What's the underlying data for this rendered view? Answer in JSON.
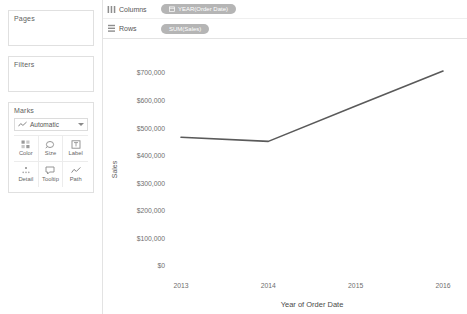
{
  "sidebar": {
    "pages": {
      "title": "Pages"
    },
    "filters": {
      "title": "Filters"
    },
    "marks": {
      "title": "Marks",
      "mark_type": "Automatic",
      "mark_type_icon": "line-mark-icon",
      "buttons": [
        {
          "label": "Color",
          "icon": "color-palette-icon"
        },
        {
          "label": "Size",
          "icon": "size-icon"
        },
        {
          "label": "Label",
          "icon": "label-icon"
        },
        {
          "label": "Detail",
          "icon": "detail-icon"
        },
        {
          "label": "Tooltip",
          "icon": "tooltip-icon"
        },
        {
          "label": "Path",
          "icon": "path-icon"
        }
      ]
    }
  },
  "shelves": [
    {
      "name": "Columns",
      "icon": "columns-icon",
      "pill": {
        "label": "YEAR(Order Date)",
        "icon": "calendar-icon",
        "color": "#b5b5b5"
      }
    },
    {
      "name": "Rows",
      "icon": "rows-icon",
      "pill": {
        "label": "SUM(Sales)",
        "icon": "",
        "color": "#b5b5b5"
      }
    }
  ],
  "chart_data": {
    "type": "line",
    "title": "",
    "xlabel": "Year of Order Date",
    "ylabel": "Sales",
    "x": [
      "2013",
      "2014",
      "2015",
      "2016"
    ],
    "categories": [
      "2013",
      "2014",
      "2015",
      "2016"
    ],
    "values": [
      467000,
      452000,
      580000,
      707000
    ],
    "series": [
      {
        "name": "SUM(Sales)",
        "values": [
          467000,
          452000,
          580000,
          707000
        ]
      }
    ],
    "ylim": [
      0,
      700000
    ],
    "yticks": [
      0,
      100000,
      200000,
      300000,
      400000,
      500000,
      600000,
      700000
    ],
    "ytick_labels": [
      "$0",
      "$100,000",
      "$200,000",
      "$300,000",
      "$400,000",
      "$500,000",
      "$600,000",
      "$700,000"
    ],
    "xtick_labels": [
      "2013",
      "2014",
      "2015",
      "2016"
    ],
    "grid": false,
    "legend": "none",
    "line_color": "#5a5a5a"
  }
}
